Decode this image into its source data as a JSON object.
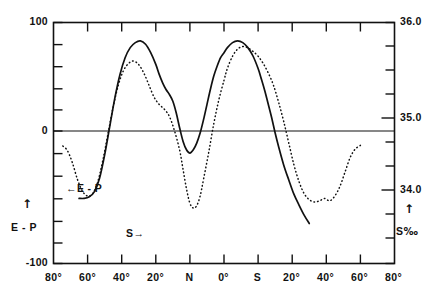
{
  "chart_data": {
    "type": "line",
    "title": "",
    "xlabel": "",
    "ylabel": "E - P",
    "y2label": "S ‰",
    "grid": false,
    "legend_position": "inline-annotations",
    "x_axis": {
      "tick_labels": [
        "80°",
        "60°",
        "40°",
        "20°",
        "N",
        "0°",
        "S",
        "20°",
        "40°",
        "60°",
        "80°"
      ],
      "tick_values": [
        80,
        60,
        40,
        20,
        0,
        0,
        0,
        -20,
        -40,
        -60,
        -80
      ],
      "description": "Latitude, north on the left through the equator to south on the right"
    },
    "y_axis_left": {
      "label": "E - P",
      "arrow": "↑",
      "tick_labels": [
        "100",
        "0",
        "-100"
      ],
      "ylim": [
        -100,
        100
      ],
      "major_ticks": [
        100,
        0,
        -100
      ],
      "minor_tick_interval": 20
    },
    "y_axis_right": {
      "label": "S ‰",
      "arrow": "↑",
      "tick_labels": [
        "36.0",
        "35.0",
        "34.0"
      ],
      "ylim": [
        33.6,
        36.0
      ],
      "major_ticks": [
        36.0,
        35.0,
        34.0
      ],
      "minor_tick_interval": 0.2
    },
    "annotations": [
      {
        "text": "←E - P",
        "series": "E-P",
        "x_px": 70,
        "y_px": 188
      },
      {
        "text": "S→",
        "series": "S",
        "x_px": 128,
        "y_px": 232
      }
    ],
    "series": [
      {
        "name": "S",
        "label": "S",
        "style": "solid",
        "axis": "right",
        "units": "‰",
        "points": [
          [
            -50.0,
            33.6
          ],
          [
            -47.0,
            33.7
          ],
          [
            -44.0,
            33.82
          ],
          [
            -41.0,
            33.95
          ],
          [
            -38.0,
            34.12
          ],
          [
            -35.0,
            34.3
          ],
          [
            -32.0,
            34.52
          ],
          [
            -30.0,
            34.68
          ],
          [
            -28.0,
            34.86
          ],
          [
            -26.0,
            35.02
          ],
          [
            -24.0,
            35.18
          ],
          [
            -22.0,
            35.32
          ],
          [
            -20.0,
            35.45
          ],
          [
            -17.0,
            35.6
          ],
          [
            -14.0,
            35.7
          ],
          [
            -11.0,
            35.76
          ],
          [
            -8.0,
            35.78
          ],
          [
            -5.0,
            35.76
          ],
          [
            -2.0,
            35.7
          ],
          [
            0.0,
            35.64
          ],
          [
            2.0,
            35.58
          ],
          [
            4.0,
            35.48
          ],
          [
            6.0,
            35.36
          ],
          [
            8.0,
            35.2
          ],
          [
            10.0,
            35.02
          ],
          [
            12.0,
            34.84
          ],
          [
            14.0,
            34.68
          ],
          [
            16.0,
            34.56
          ],
          [
            18.0,
            34.48
          ],
          [
            20.0,
            34.44
          ],
          [
            22.0,
            34.48
          ],
          [
            24.0,
            34.58
          ],
          [
            26.0,
            34.74
          ],
          [
            28.0,
            34.92
          ],
          [
            30.0,
            35.06
          ],
          [
            32.0,
            35.14
          ],
          [
            34.0,
            35.2
          ],
          [
            36.0,
            35.28
          ],
          [
            38.0,
            35.38
          ],
          [
            40.0,
            35.5
          ],
          [
            43.0,
            35.64
          ],
          [
            46.0,
            35.74
          ],
          [
            49.0,
            35.78
          ],
          [
            52.0,
            35.76
          ],
          [
            55.0,
            35.7
          ],
          [
            58.0,
            35.58
          ],
          [
            61.0,
            35.38
          ],
          [
            64.0,
            35.1
          ],
          [
            67.0,
            34.76
          ],
          [
            70.0,
            34.42
          ],
          [
            73.0,
            34.14
          ],
          [
            76.0,
            33.98
          ],
          [
            79.0,
            33.92
          ],
          [
            82.0,
            33.9
          ],
          [
            85.0,
            33.9
          ]
        ]
      },
      {
        "name": "E-P",
        "label": "E - P",
        "style": "dotted",
        "axis": "left",
        "units": "",
        "points": [
          [
            -80.0,
            -2.0
          ],
          [
            -77.0,
            -5.0
          ],
          [
            -74.0,
            -12.0
          ],
          [
            -71.0,
            -24.0
          ],
          [
            -68.0,
            -36.0
          ],
          [
            -65.0,
            -44.0
          ],
          [
            -62.0,
            -48.0
          ],
          [
            -59.0,
            -46.0
          ],
          [
            -56.0,
            -48.0
          ],
          [
            -53.0,
            -49.0
          ],
          [
            -50.0,
            -47.0
          ],
          [
            -47.0,
            -42.0
          ],
          [
            -44.0,
            -32.0
          ],
          [
            -41.0,
            -18.0
          ],
          [
            -38.0,
            0.0
          ],
          [
            -35.0,
            18.0
          ],
          [
            -32.0,
            34.0
          ],
          [
            -29.0,
            48.0
          ],
          [
            -26.0,
            58.0
          ],
          [
            -23.0,
            66.0
          ],
          [
            -20.0,
            72.0
          ],
          [
            -17.0,
            76.0
          ],
          [
            -14.0,
            79.0
          ],
          [
            -11.0,
            80.0
          ],
          [
            -8.0,
            78.0
          ],
          [
            -5.0,
            72.0
          ],
          [
            -2.0,
            62.0
          ],
          [
            0.0,
            52.0
          ],
          [
            3.0,
            36.0
          ],
          [
            6.0,
            16.0
          ],
          [
            9.0,
            -8.0
          ],
          [
            12.0,
            -30.0
          ],
          [
            14.0,
            -44.0
          ],
          [
            16.0,
            -52.0
          ],
          [
            18.0,
            -54.0
          ],
          [
            20.0,
            -50.0
          ],
          [
            22.0,
            -38.0
          ],
          [
            24.0,
            -22.0
          ],
          [
            26.0,
            -6.0
          ],
          [
            29.0,
            10.0
          ],
          [
            32.0,
            22.0
          ],
          [
            35.0,
            28.0
          ],
          [
            38.0,
            32.0
          ],
          [
            41.0,
            38.0
          ],
          [
            44.0,
            48.0
          ],
          [
            47.0,
            58.0
          ],
          [
            50.0,
            65.0
          ],
          [
            53.0,
            68.0
          ],
          [
            56.0,
            66.0
          ],
          [
            59.0,
            60.0
          ],
          [
            62.0,
            48.0
          ],
          [
            65.0,
            30.0
          ],
          [
            68.0,
            8.0
          ],
          [
            71.0,
            -14.0
          ],
          [
            74.0,
            -32.0
          ],
          [
            77.0,
            -42.0
          ],
          [
            80.0,
            -44.0
          ],
          [
            83.0,
            -40.0
          ],
          [
            86.0,
            -30.0
          ],
          [
            89.0,
            -16.0
          ],
          [
            92.0,
            -6.0
          ],
          [
            95.0,
            -2.0
          ]
        ]
      }
    ]
  },
  "axes": {
    "left_ticks": [
      {
        "label": "100"
      },
      {
        "label": "0"
      },
      {
        "label": "-100"
      }
    ],
    "right_ticks": [
      {
        "label": "36.0"
      },
      {
        "label": "35.0"
      },
      {
        "label": "34.0"
      }
    ],
    "bottom_ticks": [
      {
        "label": "80°"
      },
      {
        "label": "60°"
      },
      {
        "label": "40°"
      },
      {
        "label": "20°"
      },
      {
        "label": "N"
      },
      {
        "label": "0°"
      },
      {
        "label": "S"
      },
      {
        "label": "20°"
      },
      {
        "label": "40°"
      },
      {
        "label": "60°"
      },
      {
        "label": "80°"
      }
    ],
    "left_title": "E - P",
    "left_arrow": "↑",
    "right_title_text": "S",
    "right_title_symbol": "‰",
    "right_arrow": "↑"
  },
  "annotations": {
    "ep_label": "←E - P",
    "s_label": "S→"
  },
  "colors": {
    "ink": "#111111",
    "background": "#ffffff",
    "curve": "#111111"
  }
}
